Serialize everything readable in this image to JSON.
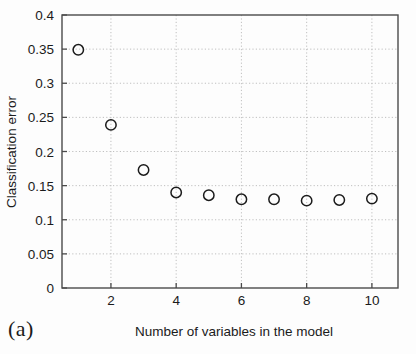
{
  "figure": {
    "panel_caption": "(a)"
  },
  "chart_data": {
    "type": "scatter",
    "title": "",
    "xlabel": "Number of variables in the model",
    "ylabel": "Classification error",
    "x": [
      1,
      2,
      3,
      4,
      5,
      6,
      7,
      8,
      9,
      10
    ],
    "values": [
      0.349,
      0.239,
      0.173,
      0.14,
      0.136,
      0.13,
      0.13,
      0.128,
      0.129,
      0.131
    ],
    "series": [
      {
        "name": "Classification error",
        "values": [
          0.349,
          0.239,
          0.173,
          0.14,
          0.136,
          0.13,
          0.13,
          0.128,
          0.129,
          0.131
        ]
      }
    ],
    "xlim": [
      0.5,
      10.8
    ],
    "ylim": [
      0,
      0.4
    ],
    "xticks": [
      2,
      4,
      6,
      8,
      10
    ],
    "xtick_labels": [
      "2",
      "4",
      "6",
      "8",
      "10"
    ],
    "yticks": [
      0,
      0.05,
      0.1,
      0.15,
      0.2,
      0.25,
      0.3,
      0.35,
      0.4
    ],
    "ytick_labels": [
      "0",
      "0.05",
      "0.1",
      "0.15",
      "0.2",
      "0.25",
      "0.3",
      "0.35",
      "0.4"
    ],
    "grid": true,
    "grid_style": "dotted",
    "legend": null,
    "marker": "open-circle",
    "marker_color": "#1b1b1b",
    "marker_fill": "none",
    "axis_color": "#4a4a4a",
    "grid_color": "#b9b9b9",
    "background": "#fdfdfd"
  }
}
